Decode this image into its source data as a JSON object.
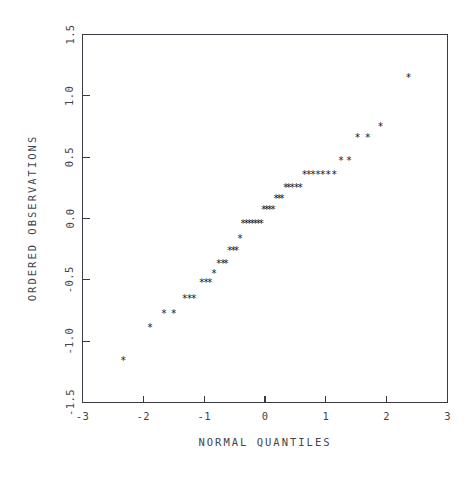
{
  "figure": {
    "background": "#ffffff",
    "frame_color": "#3a3a42",
    "marker_color": "#151519",
    "marker_glyph": "*"
  },
  "chart_data": {
    "type": "scatter",
    "title": "",
    "subtitle": "",
    "xlabel": "NORMAL QUANTILES",
    "ylabel": "ORDERED OBSERVATIONS",
    "xlim": [
      -3,
      3
    ],
    "ylim": [
      -1.5,
      1.5
    ],
    "xticks": [
      -3,
      -2,
      -1,
      0,
      1,
      2,
      3
    ],
    "xticklabels": [
      "-3",
      "-2",
      "-1",
      "0",
      "1",
      "2",
      "3"
    ],
    "yticks": [
      -1.5,
      -1.0,
      -0.5,
      0.0,
      0.5,
      1.0,
      1.5
    ],
    "yticklabels": [
      "-1.5",
      "-1.0",
      "-0.5",
      "0.0",
      "0.5",
      "1.0",
      "1.5"
    ],
    "grid": false,
    "legend": null,
    "annotations": [],
    "marker": "asterisk",
    "series": [
      {
        "name": "ordered observations",
        "x": [
          -2.33,
          -1.89,
          -1.66,
          -1.5,
          -1.32,
          -1.24,
          -1.17,
          -1.04,
          -0.97,
          -0.91,
          -0.84,
          -0.76,
          -0.69,
          -0.64,
          -0.58,
          -0.52,
          -0.47,
          -0.41,
          -0.36,
          -0.31,
          -0.26,
          -0.21,
          -0.16,
          -0.11,
          -0.06,
          -0.02,
          0.03,
          0.08,
          0.13,
          0.18,
          0.23,
          0.28,
          0.34,
          0.39,
          0.45,
          0.52,
          0.58,
          0.65,
          0.72,
          0.79,
          0.87,
          0.95,
          1.04,
          1.14,
          1.25,
          1.38,
          1.52,
          1.69,
          1.9,
          2.36
        ],
        "y": [
          -1.14,
          -0.87,
          -0.75,
          -0.75,
          -0.63,
          -0.63,
          -0.63,
          -0.5,
          -0.5,
          -0.5,
          -0.43,
          -0.35,
          -0.35,
          -0.35,
          -0.24,
          -0.24,
          -0.24,
          -0.14,
          -0.02,
          -0.02,
          -0.02,
          -0.02,
          -0.02,
          -0.02,
          -0.02,
          0.09,
          0.09,
          0.09,
          0.09,
          0.18,
          0.18,
          0.18,
          0.27,
          0.27,
          0.27,
          0.27,
          0.27,
          0.38,
          0.38,
          0.38,
          0.38,
          0.38,
          0.38,
          0.38,
          0.49,
          0.49,
          0.68,
          0.68,
          0.77,
          1.17
        ]
      }
    ]
  }
}
